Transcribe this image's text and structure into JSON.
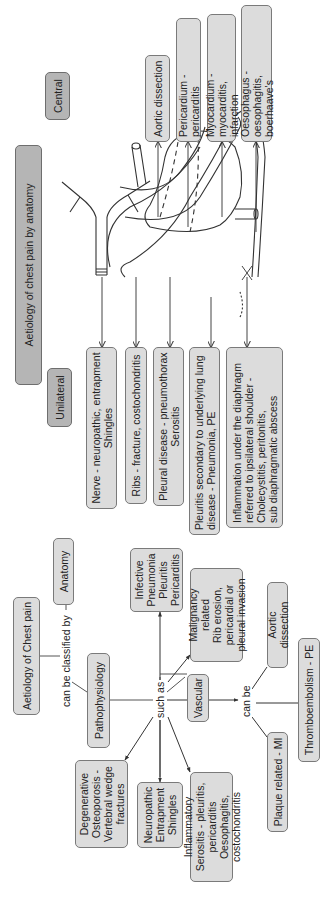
{
  "anatomy_section": {
    "title": "Aetiology of chest pain by anatomy",
    "central": {
      "header": "Central",
      "items": [
        "Aortic dissection",
        "Pericardium - pericarditis",
        "Myocardium - myocarditis,\ninfarction",
        "Oesophagus - oesophagitis,\nboerhaave's"
      ]
    },
    "unilateral": {
      "header": "Unilateral",
      "items": [
        "Nerve - neuropathic, entrapment\nShingles",
        "Ribs - fracture, costochondritis",
        "Pleural disease - pneumothorax\nSerositis",
        "Pleuritis secondary to underlying lung\ndisease - Pneumonia, PE",
        "Inflammation under the diaphragm\nreferred to ipsilateral shoulder -\nCholecystitis, peritonitis,\nsub diaphragmatic abscess"
      ]
    }
  },
  "pathophysiology_section": {
    "root": "Aetiology of Chest pain",
    "link_label": "can be classified by",
    "anatomy": "Anatomy",
    "pathophysiology": "Pathophysiology",
    "such_as": "such as",
    "categories": {
      "degenerative": "Degenerative\nOsteoporosis -\nVertebral wedge\nfractures",
      "neuropathic": "Neuropathic\nEntrapment\nShingles",
      "inflammatory": "Inflammatory\nSerositis - pleuritis, pericarditis\nOesophagitis, costochondritis",
      "infective": "Infective\nPneumonia\nPleuritis\nPericarditis",
      "malignancy": "Malignancy related\nRib erosion,\npericardial or\npleural invasion",
      "vascular": "Vascular"
    },
    "vascular_link": "can be",
    "vascular_types": {
      "aortic_dissection": "Aortic dissection",
      "thromboembolism": "Thromboembolism - PE",
      "plaque": "Plaque related - MI"
    }
  },
  "colors": {
    "box_fill": "#dcdcdc",
    "header_fill": "#b5b5b5",
    "border": "#7a7a7a",
    "line": "#444444"
  }
}
